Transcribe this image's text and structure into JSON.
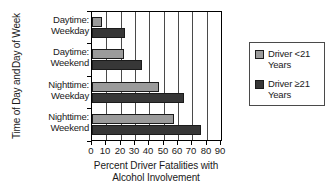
{
  "chart_data": {
    "type": "bar",
    "orientation": "horizontal",
    "title": "",
    "xlabel_line1": "Percent Driver Fatalities with",
    "xlabel_line2": "Alcohol Involvement",
    "ylabel_line1": "Time of Day and",
    "ylabel_line2": "Day of Week",
    "categories": [
      "Daytime:\nWeekday",
      "Daytime:\nWeekend",
      "Nighttime:\nWeekday",
      "Nighttime:\nWeekend"
    ],
    "category_lines": [
      [
        "Daytime:",
        "Weekday"
      ],
      [
        "Daytime:",
        "Weekend"
      ],
      [
        "Nighttime:",
        "Weekday"
      ],
      [
        "Nighttime:",
        "Weekend"
      ]
    ],
    "series": [
      {
        "name": "Driver <21 Years",
        "color": "#9b9b9b",
        "values": [
          7,
          22,
          47,
          57
        ]
      },
      {
        "name": "Driver ≥21 Years",
        "color": "#373737",
        "values": [
          23,
          35,
          64,
          76
        ]
      }
    ],
    "xlim": [
      0,
      90
    ],
    "xticks": [
      0,
      10,
      20,
      30,
      40,
      50,
      60,
      70,
      80,
      90
    ],
    "xticklabels": [
      "0",
      "10",
      "20",
      "30",
      "40",
      "50",
      "60",
      "70",
      "80",
      "90"
    ],
    "grid": "vertical",
    "legend_position": "right"
  },
  "legend": {
    "entries": [
      {
        "label_line1": "Driver <21",
        "label_line2": "Years",
        "color": "#9b9b9b"
      },
      {
        "label_line1": "Driver ≥21",
        "label_line2": "Years",
        "color": "#373737"
      }
    ]
  }
}
